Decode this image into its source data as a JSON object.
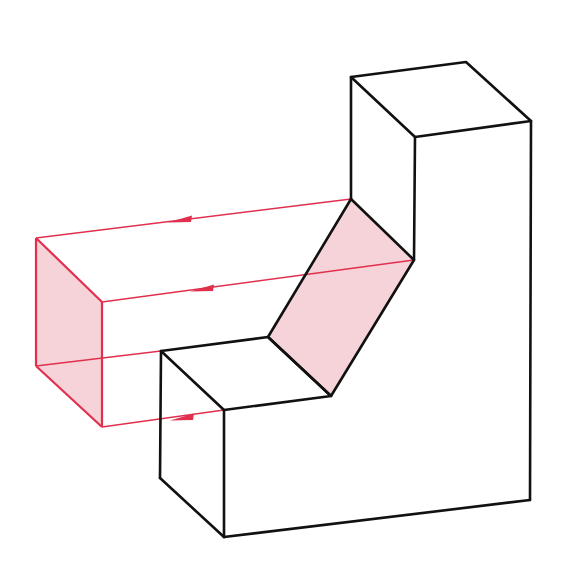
{
  "diagram": {
    "colors": {
      "object_edge": "#111111",
      "projection": "#e0304e",
      "shaded_face": "#f6d3d8",
      "background": "#ffffff"
    },
    "object": {
      "upper_block_top_face": [
        [
          351,
          77
        ],
        [
          466,
          62
        ],
        [
          531,
          121
        ],
        [
          415,
          137
        ]
      ],
      "inclined_face": [
        [
          351,
          199
        ],
        [
          414,
          260
        ],
        [
          331,
          396
        ],
        [
          268,
          337
        ]
      ],
      "lower_step_top_face": [
        [
          161,
          351
        ],
        [
          268,
          337
        ],
        [
          331,
          396
        ],
        [
          224,
          410
        ]
      ],
      "vertical_edges": [
        [
          [
            351,
            77
          ],
          [
            351,
            199
          ]
        ],
        [
          [
            415,
            137
          ],
          [
            414,
            260
          ]
        ],
        [
          [
            531,
            121
          ],
          [
            530,
            500
          ]
        ],
        [
          [
            161,
            351
          ],
          [
            160,
            478
          ]
        ],
        [
          [
            224,
            410
          ],
          [
            224,
            537
          ]
        ]
      ],
      "bottom_edges": [
        [
          [
            160,
            478
          ],
          [
            224,
            537
          ]
        ],
        [
          [
            224,
            537
          ],
          [
            530,
            500
          ]
        ]
      ]
    },
    "projection": {
      "projected_face": [
        [
          36,
          238
        ],
        [
          102,
          302
        ],
        [
          102,
          427
        ],
        [
          36,
          366
        ]
      ],
      "projector_lines": [
        {
          "from": [
            351,
            199
          ],
          "to": [
            36,
            238
          ],
          "arrow_at": [
            178,
            220
          ]
        },
        {
          "from": [
            414,
            260
          ],
          "to": [
            102,
            302
          ],
          "arrow_at": [
            200,
            289
          ]
        },
        {
          "from": [
            224,
            410
          ],
          "to": [
            102,
            427
          ],
          "arrow_at": [
            178,
            419
          ]
        }
      ],
      "hidden_line": {
        "from": [
          36,
          366
        ],
        "to": [
          161,
          351
        ]
      }
    }
  }
}
